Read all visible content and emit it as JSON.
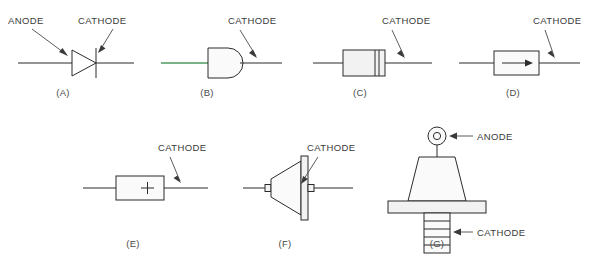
{
  "figure": {
    "background_color": "#ffffff",
    "line_color": "#2b2b2b",
    "label_color": "#3a3a3a",
    "accent_green": "#4f9a62",
    "body_fill": "#f2f2f2"
  },
  "labels": {
    "anode": "ANODE",
    "cathode": "CATHODE"
  },
  "panels": [
    {
      "id": "a",
      "letter": "(A)",
      "kind": "schematic-symbol",
      "description": "diode schematic symbol, triangle with cathode bar",
      "callouts": [
        "ANODE",
        "CATHODE"
      ]
    },
    {
      "id": "b",
      "letter": "(B)",
      "kind": "dome-package",
      "description": "bullet / dome shaped glass package with green anode lead",
      "callouts": [
        "CATHODE"
      ]
    },
    {
      "id": "c",
      "letter": "(C)",
      "kind": "axial-cylindrical-package",
      "description": "axial cylindrical package with cathode band near right end",
      "callouts": [
        "CATHODE"
      ]
    },
    {
      "id": "d",
      "letter": "(D)",
      "kind": "rectangular-arrow-package",
      "description": "rectangular body marked with arrow pointing to cathode",
      "callouts": [
        "CATHODE"
      ]
    },
    {
      "id": "e",
      "letter": "(E)",
      "kind": "rectangular-plus-package",
      "description": "rectangular body marked with plus sign",
      "callouts": [
        "CATHODE"
      ],
      "marking": "+"
    },
    {
      "id": "f",
      "letter": "(F)",
      "kind": "cone-package",
      "description": "conical body with flat cathode plate on right",
      "callouts": [
        "CATHODE"
      ]
    },
    {
      "id": "g",
      "letter": "(G)",
      "kind": "stud-mount-package",
      "description": "stud mount diode, ring terminal anode on top, threaded stud cathode below",
      "callouts": [
        "ANODE",
        "CATHODE"
      ]
    }
  ]
}
